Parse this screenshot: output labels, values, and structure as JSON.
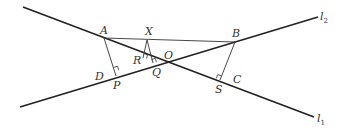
{
  "diagram": {
    "lines": [
      {
        "name": "l1",
        "label": "l",
        "sub": "1",
        "x1": 23,
        "y1": 7,
        "x2": 314,
        "y2": 117
      },
      {
        "name": "l2",
        "label": "l",
        "sub": "2",
        "x1": 20,
        "y1": 107,
        "x2": 318,
        "y2": 17
      }
    ],
    "points": {
      "A": {
        "label": "A",
        "x": 104,
        "y": 38
      },
      "B": {
        "label": "B",
        "x": 235,
        "y": 42
      },
      "X": {
        "label": "X",
        "x": 147,
        "y": 40
      },
      "O": {
        "label": "O",
        "x": 172,
        "y": 61
      },
      "R": {
        "label": "R",
        "x": 145,
        "y": 57
      },
      "Q": {
        "label": "Q",
        "x": 153,
        "y": 63
      },
      "P": {
        "label": "P",
        "x": 116,
        "y": 76
      },
      "D": {
        "label": "D",
        "x": 98,
        "y": 76
      },
      "S": {
        "label": "S",
        "x": 220,
        "y": 80
      },
      "C": {
        "label": "C",
        "x": 236,
        "y": 80
      }
    },
    "labels": {
      "A": "A",
      "B": "B",
      "X": "X",
      "O": "O",
      "R": "R",
      "Q": "Q",
      "P": "P",
      "D": "D",
      "S": "S",
      "C": "C",
      "l1": "l",
      "l1_sub": "1",
      "l2": "l",
      "l2_sub": "2"
    }
  }
}
